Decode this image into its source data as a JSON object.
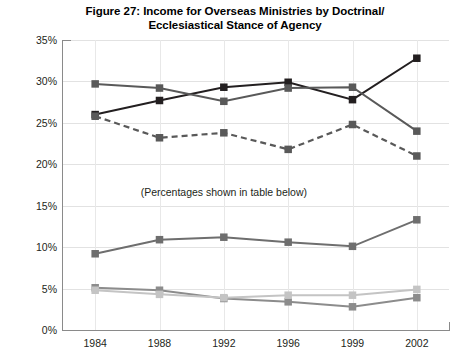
{
  "chart_data": {
    "type": "line",
    "title": "Figure 27: Income for Overseas Ministries by Doctrinal/ Ecclesiastical Stance of Agency",
    "title_lines": [
      "Figure 27: Income for Overseas Ministries by Doctrinal/",
      "Ecclesiastical Stance of Agency"
    ],
    "xlabel": "",
    "ylabel": "",
    "categories": [
      "1984",
      "1988",
      "1992",
      "1996",
      "1999",
      "2002"
    ],
    "ylim": [
      0,
      35
    ],
    "ytick_labels": [
      "0%",
      "5%",
      "10%",
      "15%",
      "20%",
      "25%",
      "30%",
      "35%"
    ],
    "ytick_values": [
      0,
      5,
      10,
      15,
      20,
      25,
      30,
      35
    ],
    "grid": true,
    "legend": "none",
    "annotations": [
      {
        "text": "(Percentages shown in table below)",
        "x_category": "1992",
        "y_value": 16.7
      }
    ],
    "series": [
      {
        "name": "series-1-black-solid",
        "color": "#231f20",
        "style": "solid",
        "marker": "square",
        "values": [
          26.0,
          27.7,
          29.3,
          29.9,
          27.8,
          32.8
        ]
      },
      {
        "name": "series-2-dark-gray-solid",
        "color": "#595959",
        "style": "solid",
        "marker": "square",
        "values": [
          29.7,
          29.2,
          27.6,
          29.2,
          29.3,
          24.0
        ]
      },
      {
        "name": "series-3-gray-dashed",
        "color": "#595959",
        "style": "dashed",
        "marker": "square",
        "values": [
          25.8,
          23.2,
          23.8,
          21.8,
          24.8,
          21.0
        ]
      },
      {
        "name": "series-4-mid-gray-solid",
        "color": "#6e6e6e",
        "style": "solid",
        "marker": "square",
        "values": [
          9.2,
          10.9,
          11.2,
          10.6,
          10.1,
          13.3
        ]
      },
      {
        "name": "series-5-gray-solid",
        "color": "#8c8c8c",
        "style": "solid",
        "marker": "square",
        "values": [
          5.1,
          4.8,
          3.8,
          3.4,
          2.8,
          3.9
        ]
      },
      {
        "name": "series-6-light-gray-solid",
        "color": "#c4c4c4",
        "style": "solid",
        "marker": "square",
        "values": [
          4.8,
          4.3,
          3.9,
          4.2,
          4.2,
          4.9
        ]
      }
    ]
  }
}
